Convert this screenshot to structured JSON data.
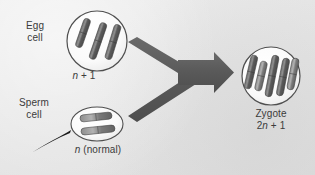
{
  "figure": {
    "background_color": "#e7e7e7",
    "ink_color": "#555555",
    "chromosome_color": "#5e5e5e",
    "cell_fill_color": "#fbfbfb"
  },
  "labels": {
    "egg_cell": "Egg\ncell",
    "egg_cell_line1": "Egg",
    "egg_cell_line2": "cell",
    "sperm_cell_line1": "Sperm",
    "sperm_cell_line2": "cell",
    "egg_ploidy": "n + 1",
    "egg_ploidy_prefix": "n",
    "egg_ploidy_suffix": " + 1",
    "sperm_ploidy_prefix": "n",
    "sperm_ploidy_suffix": " (normal)",
    "zygote_name": "Zygote",
    "zygote_ploidy_prefix": "2",
    "zygote_ploidy_italic": "n",
    "zygote_ploidy_suffix": " + 1"
  },
  "cells": {
    "egg": {
      "name": "egg-cell",
      "shape": "circle",
      "chromosome_count": 3,
      "ploidy": "n + 1"
    },
    "sperm": {
      "name": "sperm-cell",
      "shape": "ellipse",
      "chromosome_count": 2,
      "ploidy": "n",
      "has_flagellum": true
    },
    "zygote": {
      "name": "zygote-cell",
      "shape": "circle",
      "chromosome_count": 5,
      "ploidy": "2n + 1"
    }
  },
  "arrow": {
    "name": "fusion-arrow",
    "shape": "merging-y-arrow",
    "direction": "right",
    "color": "#595959"
  }
}
